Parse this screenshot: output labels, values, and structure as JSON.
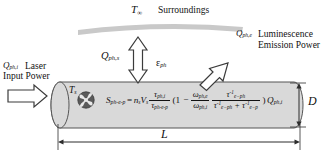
{
  "figure": {
    "title_symbol": "T∞",
    "title_text": "Surroundings",
    "colors": {
      "cylinder_fill": "#d9d9d9",
      "cylinder_stroke": "#555555",
      "surroundings_arc": "#c9c9c9",
      "arrow_stroke": "#3b3b3b",
      "arrow_fill": "#ffffff",
      "atom_icon": "#5a5a5a",
      "text": "#111111"
    }
  },
  "labels": {
    "ambient_temperature": "T∞",
    "surroundings": "Surroundings",
    "heat_exchange_symbol": "Q",
    "heat_exchange_sub": "ph,s",
    "emissivity_symbol": "ε",
    "emissivity_sub": "ph",
    "luminescence_symbol": "Q",
    "luminescence_sub": "ph,e",
    "luminescence_line1": "Luminescence",
    "luminescence_line2": "Emission Power",
    "laser_symbol": "Q",
    "laser_sub": "ph,i",
    "laser_line1": "Laser",
    "laser_line2": "Input Power",
    "sample_temperature_symbol": "T",
    "sample_temperature_sub": "s",
    "diameter": "D",
    "length": "L"
  },
  "equation": {
    "plain": "S_ph-e-p = n_s V_s (τ_ph,i / τ_ph-e-p) ( 1 - (ω_ph,e / ω_ph,i)(τ⁻¹_e-ph / (τ⁻¹_e-ph + τ⁻¹_e-p)) ) Q_ph,i",
    "lhs_symbol": "S",
    "lhs_sub": "ph-e-p",
    "equals": "=",
    "coeff_n_symbol": "n",
    "coeff_n_sub": "s",
    "coeff_V_symbol": "V",
    "coeff_V_sub": "s",
    "frac1_num_symbol": "τ",
    "frac1_num_sub": "ph,i",
    "frac1_den_symbol": "τ",
    "frac1_den_sub": "ph-e-p",
    "open_paren": "(1",
    "minus": "−",
    "frac2_num_symbol": "ω",
    "frac2_num_sub": "ph,e",
    "frac2_den_symbol": "ω",
    "frac2_den_sub": "ph,i",
    "frac3_num_symbol": "τ",
    "frac3_num_sub": "e−ph",
    "frac3_num_sup": "-1",
    "frac3_den_left_symbol": "τ",
    "frac3_den_left_sub": "e−ph",
    "frac3_den_left_sup": "-1",
    "frac3_den_plus": "+",
    "frac3_den_right_symbol": "τ",
    "frac3_den_right_sub": "e−p",
    "frac3_den_right_sup": "-1",
    "close_paren": ")",
    "rhs_symbol": "Q",
    "rhs_sub": "ph,i"
  },
  "icons": {
    "atom": "atom-icon",
    "laser_arrow": "arrow-right-icon",
    "emission_arrow": "arrow-up-right-icon",
    "exchange_arrow": "arrow-up-down-icon",
    "diameter_arrow": "dimension-arrow-vertical-icon",
    "length_arrow": "dimension-arrow-horizontal-icon"
  }
}
